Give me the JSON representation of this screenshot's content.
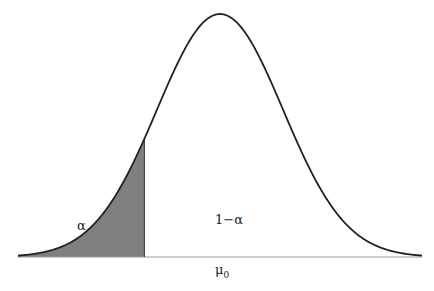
{
  "chart_data": {
    "type": "area",
    "title": "",
    "distribution": "normal",
    "mean_label": "μ",
    "mean_subscript": "0",
    "regions": [
      {
        "name": "rejection",
        "label": "α",
        "shaded": true,
        "fill": "#808080",
        "z_range": [
          -4,
          -1.2
        ]
      },
      {
        "name": "acceptance",
        "label": "1−α",
        "shaded": false,
        "fill": "#ffffff",
        "z_range": [
          -1.2,
          4
        ]
      }
    ],
    "critical_z": -1.2,
    "xlabel": "",
    "ylabel": "",
    "grid": false,
    "colors": {
      "curve": "#222222",
      "shade": "#808080",
      "axis": "#888888"
    }
  },
  "labels": {
    "alpha": "α",
    "one_minus_alpha": "1−α",
    "mu": "μ",
    "mu_sub": "0"
  }
}
